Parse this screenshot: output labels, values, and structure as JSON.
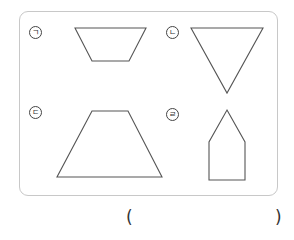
{
  "diagram": {
    "labels": [
      "ㄱ",
      "ㄴ",
      "ㄷ",
      "ㄹ"
    ],
    "shapes": [
      {
        "label": "ㄱ",
        "type": "trapezoid",
        "points": "75,28 146,28 129,61 92,61"
      },
      {
        "label": "ㄴ",
        "type": "triangle",
        "points": "191,28 263,28 227,93"
      },
      {
        "label": "ㄷ",
        "type": "trapezoid",
        "points": "92,111 128,111 162,177 57,177"
      },
      {
        "label": "ㄹ",
        "type": "pentagon",
        "points": "227,110 245,142 245,180 209,180 209,142"
      }
    ],
    "stroke_color": "#555555",
    "frame_color": "#c8c8c8"
  },
  "answer": {
    "open_paren": "(",
    "close_paren": ")",
    "value": ""
  }
}
